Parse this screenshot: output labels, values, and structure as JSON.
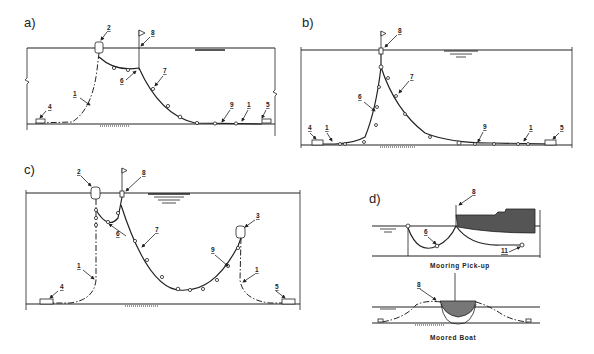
{
  "panels": {
    "a": {
      "label": "a)",
      "callouts": [
        "2",
        "8",
        "6",
        "7",
        "1",
        "4",
        "9",
        "1",
        "5"
      ]
    },
    "b": {
      "label": "b)",
      "callouts": [
        "8",
        "7",
        "6",
        "4",
        "1",
        "9",
        "1",
        "5"
      ]
    },
    "c": {
      "label": "c)",
      "callouts": [
        "2",
        "8",
        "6",
        "7",
        "3",
        "9",
        "1",
        "1",
        "4",
        "5"
      ]
    },
    "d": {
      "label": "d)",
      "top_callouts": [
        "8",
        "6",
        "11"
      ],
      "top_caption": "Mooring Pick-up",
      "bottom_callouts": [
        "8"
      ],
      "bottom_caption": "Moored Boat"
    }
  },
  "colors": {
    "ink": "#222222",
    "hull_fill": "#555555",
    "background": "#ffffff"
  }
}
